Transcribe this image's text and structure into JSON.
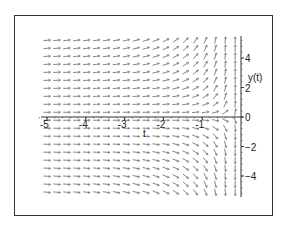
{
  "chart_data": {
    "type": "direction_field",
    "title": "",
    "xlabel": "t",
    "ylabel": "y(t)",
    "equation_estimated": "dy/dt = y / t^2",
    "xlim": [
      -5.2,
      0
    ],
    "ylim": [
      -5.3,
      5.5
    ],
    "x_ticks": [
      -5,
      -4,
      -3,
      -2,
      -1,
      0
    ],
    "x_tick_labels": [
      "-5",
      "-4",
      "-3",
      "-2",
      "-1"
    ],
    "y_ticks": [
      4,
      2,
      0,
      -2,
      -4
    ],
    "y_tick_labels": [
      "4",
      "2",
      "0",
      "-2",
      "-4"
    ],
    "grid": false,
    "legend": null,
    "field_grid": {
      "t_start": -5.0,
      "t_end": -0.15,
      "t_count": 20,
      "y_start": 5.2,
      "y_end": -5.1,
      "y_count": 20
    },
    "arrow_color": "#777777",
    "axis_color": "#333333"
  }
}
